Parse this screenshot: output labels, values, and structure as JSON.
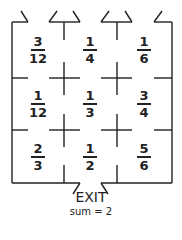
{
  "puzzle": {
    "type": "fraction-maze",
    "rows": 3,
    "cols": 3,
    "cells": [
      [
        {
          "num": "3",
          "den": "12"
        },
        {
          "num": "1",
          "den": "4"
        },
        {
          "num": "1",
          "den": "6"
        }
      ],
      [
        {
          "num": "1",
          "den": "12"
        },
        {
          "num": "1",
          "den": "3"
        },
        {
          "num": "3",
          "den": "4"
        }
      ],
      [
        {
          "num": "2",
          "den": "3"
        },
        {
          "num": "1",
          "den": "2"
        },
        {
          "num": "5",
          "den": "6"
        }
      ]
    ],
    "exit_label": "EXIT",
    "sum_label": "sum = 2"
  },
  "colors": {
    "line": "#222222",
    "background": "#ffffff"
  }
}
